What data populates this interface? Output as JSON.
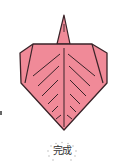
{
  "figure": {
    "label": "完成",
    "colors": {
      "paper_fill": "#F08A98",
      "outline": "#3A2328",
      "label_text": "#333333",
      "burst_dots": "#B0B0B0"
    }
  }
}
